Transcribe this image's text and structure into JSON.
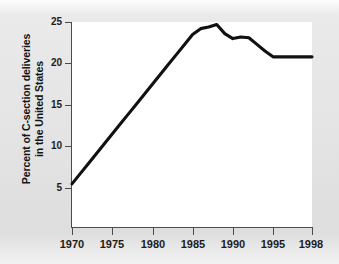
{
  "chart_data": {
    "type": "line",
    "title": "",
    "subtitle": "",
    "xlabel": "",
    "ylabel": "Percent of C-section deliveries in the United States",
    "ylabel_line1": "Percent of C-section deliveries",
    "ylabel_line2": "in the United States",
    "xlim": [
      1970,
      1998
    ],
    "ylim": [
      3,
      25
    ],
    "grid": false,
    "legend": "none",
    "line_color": "#111111",
    "plot_background": "#ffffff",
    "axis_color": "#4b4b4b",
    "xticks": [
      1970,
      1975,
      1980,
      1985,
      1990,
      1995,
      1998
    ],
    "xtick_labels": [
      "1970",
      "1975",
      "1980",
      "1985",
      "1990",
      "1995",
      "1998"
    ],
    "yticks": [
      5,
      10,
      15,
      20,
      25
    ],
    "ytick_labels": [
      "5",
      "10",
      "15",
      "20",
      "25"
    ],
    "series": [
      {
        "name": "Percent of C-section deliveries in the United States",
        "x": [
          1970,
          1971,
          1972,
          1973,
          1974,
          1975,
          1976,
          1977,
          1978,
          1979,
          1980,
          1981,
          1982,
          1983,
          1984,
          1985,
          1986,
          1987,
          1988,
          1989,
          1990,
          1991,
          1992,
          1993,
          1994,
          1995,
          1996,
          1997,
          1998
        ],
        "values": [
          5.5,
          6.7,
          7.9,
          9.1,
          10.3,
          11.5,
          12.7,
          13.9,
          15.1,
          16.3,
          17.5,
          18.7,
          19.9,
          21.1,
          22.3,
          23.5,
          24.2,
          24.4,
          24.7,
          23.6,
          23.0,
          23.2,
          23.1,
          22.3,
          21.5,
          20.8,
          20.8,
          20.8,
          20.8
        ]
      }
    ],
    "annotations": {
      "start_value": 5.5,
      "start_year": 1970,
      "peak_value": 24.7,
      "peak_year": 1988,
      "end_value": 20.8,
      "end_year": 1998
    }
  }
}
